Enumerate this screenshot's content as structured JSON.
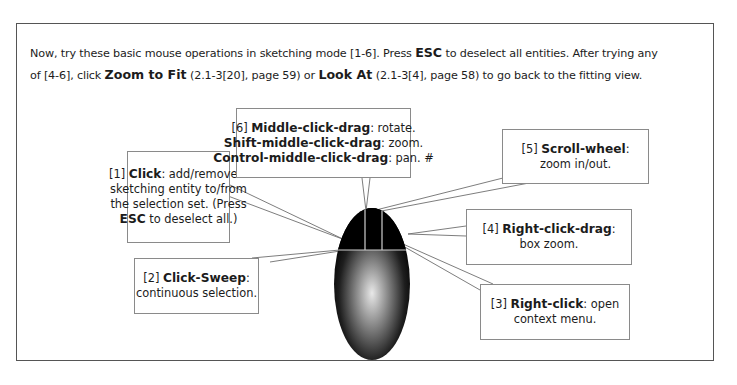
{
  "intro": {
    "line1": {
      "pre": "Now, try these basic mouse operations in sketching mode [1-6].  Press ",
      "key": "ESC",
      "post": " to deselect all entities.  After trying any"
    },
    "line2": {
      "pre": "of [4-6], click ",
      "cmd1": "Zoom to Fit",
      "ref1": " (2.1-3[20], page 59) or ",
      "cmd2": "Look At",
      "ref2": " (2.1-3[4], page 58) to go back to the fitting view."
    }
  },
  "callouts": {
    "c1": {
      "num": "[1] ",
      "action": "Click",
      "desc1": ": add/remove a",
      "desc2": "sketching entity to/from",
      "desc3": "the selection set. (Press",
      "key": "ESC",
      "desc4": " to deselect all.)"
    },
    "c2": {
      "num": "[2] ",
      "action": "Click-Sweep",
      "colon": ":",
      "desc": "continuous selection."
    },
    "c3": {
      "num": "[3] ",
      "action": "Right-click",
      "desc1": ": open",
      "desc2": "context menu."
    },
    "c4": {
      "num": "[4] ",
      "action": "Right-click-drag",
      "colon": ":",
      "desc": "box zoom."
    },
    "c5": {
      "num": "[5] ",
      "action": "Scroll-wheel",
      "colon": ":",
      "desc": "zoom in/out."
    },
    "c6": {
      "num": "[6] ",
      "action1": "Middle-click-drag",
      "desc1": ": rotate.",
      "action2": "Shift-middle-click-drag",
      "desc2": ": zoom.",
      "action3": "Control-middle-click-drag",
      "desc3": ": pan. #"
    }
  },
  "colors": {
    "frame_border": "#555555",
    "callout_border": "#8a8a8a",
    "leader_line": "#6e6e6e",
    "mouse_dark": "#000000",
    "mouse_highlight": "#e8e8e8",
    "button_divider": "#cfcfcf"
  }
}
